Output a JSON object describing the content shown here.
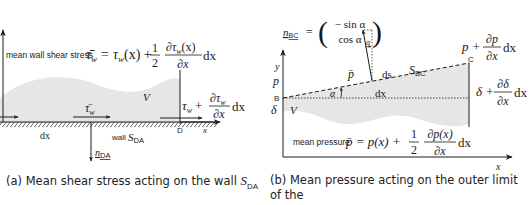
{
  "panel_a": {
    "label_text": "mean wall shear stress",
    "formula_lhs": "τ̄",
    "formula_lhs_sub": "w",
    "formula_eq": "= τ",
    "formula_eq_sub": "w",
    "formula_x": "(x) +",
    "formula_half_num": "1",
    "formula_half_den": "2",
    "formula_frac_num": "∂τ",
    "formula_frac_num_sub": "w",
    "formula_frac_num_tail": "(x)",
    "formula_frac_den": "∂x",
    "formula_dx": "dx",
    "volume_label": "V",
    "tau_bar_label": "τ̄",
    "tau_bar_sub": "w",
    "right_tau": "τ",
    "right_tau_sub": "w",
    "right_plus": "+",
    "right_frac_num": "∂τ",
    "right_frac_num_sub": "w",
    "right_frac_den": "∂x",
    "right_dx": "dx",
    "dx_label": "dx",
    "wall_label": "wall",
    "wall_surface": "S",
    "wall_surface_sub": "DA",
    "point_d": "D",
    "x_axis_label": "x",
    "normal_label": "n",
    "normal_sub": "DA",
    "caption_tag": "(a)",
    "caption_text": "Mean shear stress acting on the wall",
    "caption_surface": "S",
    "caption_surface_sub": "DA"
  },
  "panel_b": {
    "normal_lhs": "n",
    "normal_lhs_sub": "BC",
    "normal_eq": "=",
    "normal_top": "− sin α",
    "normal_bottom": "cos α",
    "alpha_top": "α",
    "p_plus": "p +",
    "p_frac_num": "∂p",
    "p_frac_den": "∂x",
    "p_dx": "dx",
    "point_c": "C",
    "point_b": "B",
    "y_axis_label": "y",
    "p_label": "p",
    "p_bar_label": "p̄",
    "ds_label": "ds",
    "surface_label": "S",
    "surface_sub": "BC",
    "alpha_label": "α",
    "dx_label": "dx",
    "delta_label": "δ",
    "volume_label": "V",
    "delta_plus": "δ +",
    "delta_frac_num": "∂δ",
    "delta_frac_den": "∂x",
    "delta_dx": "dx",
    "pressure_text": "mean pressure",
    "pressure_lhs": "p̄ = p(x) +",
    "pressure_half_num": "1",
    "pressure_half_den": "2",
    "pressure_frac_num": "∂p(x)",
    "pressure_frac_den": "∂x",
    "pressure_dx": "dx",
    "x_axis_label": "x",
    "caption_tag": "(b)",
    "caption_line1": "Mean pressure acting on the outer limit of the",
    "caption_line2": "boundary layer",
    "caption_surface": "S",
    "caption_surface_sub": "BC"
  },
  "colors": {
    "fill": "#e6e6e6",
    "stroke": "#1a1a1a",
    "text": "#1a1a1a"
  }
}
